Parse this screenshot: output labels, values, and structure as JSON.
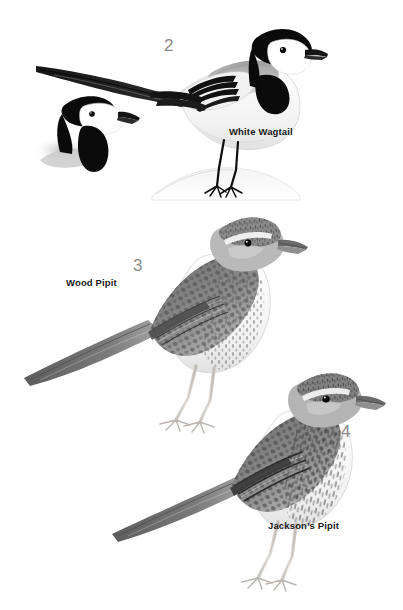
{
  "plate": {
    "type": "field-guide-illustration-plate",
    "background_color": "#ffffff",
    "medium": "grayscale watercolour / ink bird illustration",
    "label_color": "#1a1a1a",
    "numeral_color": "#8a8a8a"
  },
  "species": [
    {
      "number": "2",
      "name": "White Wagtail",
      "posture": "standing on rock, long tail angled up-left, head right",
      "features": "black crown and nape, white face, black bib, grey mantle, black-and-white barred wing, long black tail, black legs",
      "extra_figure": "head-and-shoulders study at upper left"
    },
    {
      "number": "3",
      "name": "Wood Pipit",
      "posture": "standing upright, body left-to-right, long tail to lower left",
      "features": "pale supercilium, streaked crown and breast, scalloped wing coverts with dark centres and pale fringes, white belly, pale pink legs"
    },
    {
      "number": "4",
      "name": "Jackson's Pipit",
      "posture": "standing upright, body left-to-right, long tail to lower left",
      "features": "heavily streaked crown, mantle and flanks, bold dark wing markings, white belly, pale pink legs"
    }
  ],
  "labels": {
    "white_wagtail": "White Wagtail",
    "wood_pipit": "Wood Pipit",
    "jacksons_pipit": "Jackson’s Pipit"
  },
  "numerals": {
    "two": "2",
    "three": "3",
    "four": "4"
  }
}
